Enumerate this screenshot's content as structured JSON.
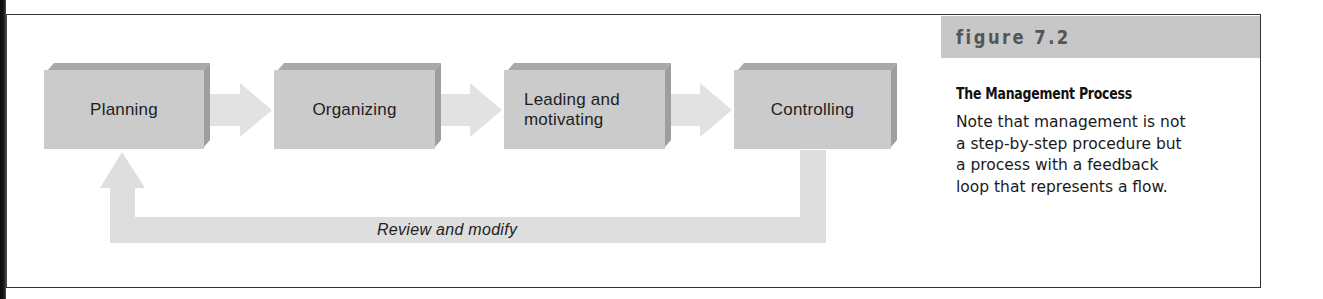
{
  "diagram": {
    "steps": [
      {
        "label": "Planning"
      },
      {
        "label": "Organizing"
      },
      {
        "label": "Leading and motivating",
        "lines": [
          "Leading and",
          "motivating"
        ]
      },
      {
        "label": "Controlling"
      }
    ],
    "feedback_loop": {
      "label": "Review and modify",
      "from": "Controlling",
      "to": "Planning"
    },
    "colors": {
      "box_face": "#cbcbcb",
      "box_bevel": "#a9a9a9",
      "arrow": "#e3e3e3",
      "feedback_arrow": "#dedede",
      "caption_banner": "#c7c7c7"
    }
  },
  "caption": {
    "figure_number": "figure 7.2",
    "title": "The Management Process",
    "body": "Note that management is not a step-by-step procedure but a process with a feedback loop that represents a flow.",
    "body_lines": [
      "Note that management is not",
      "a step-by-step procedure but",
      "a process with a feedback",
      "loop that represents a flow."
    ]
  }
}
